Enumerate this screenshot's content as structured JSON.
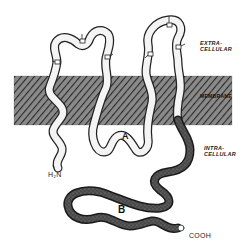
{
  "figure": {
    "labels": {
      "extracellular": "EXTRA-\nCELLULAR",
      "extracellular_line1": "EXTRA-",
      "extracellular_line2": "CELLULAR",
      "membrane": "MEMBRANE",
      "intracellular_line1": "INTRA-",
      "intracellular_line2": "CELLULAR",
      "domain_a": "A",
      "domain_b": "B",
      "n_terminus": "H₂N",
      "c_terminus": "COOH"
    },
    "colors": {
      "background": "#ffffff",
      "membrane_fill": "#6a6a6a",
      "chain_outline": "#222222",
      "chain_fill_light": "#f4f4f4",
      "chain_fill_dark": "#3a3a3a"
    },
    "glycosylation_sites": 6,
    "transmembrane_segments": 4
  }
}
